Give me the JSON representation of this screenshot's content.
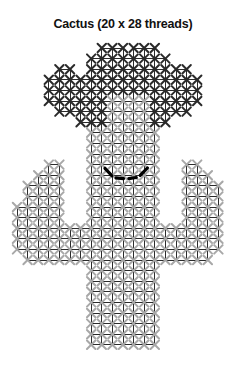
{
  "title": "Cactus (20 x 28 threads)",
  "chart_data": {
    "type": "heatmap",
    "title": "Cactus (20 x 28 threads)",
    "subtitle": "",
    "xlabel": "",
    "ylabel": "",
    "grid": true,
    "legend_position": "none",
    "columns": 20,
    "rows": 28,
    "cell_px": 10.6,
    "origin": {
      "x": 17,
      "y": 12
    },
    "colors": {
      "grid_line": "#2b2b2b",
      "body_stitch": "#a8a8a8",
      "crown_stitch": "#2a2a2a",
      "backstitch": "#000000",
      "background": "#ffffff",
      "title_text": "#111111"
    },
    "legend_entries": [
      {
        "label": "crown / flower stitch",
        "color": "#2a2a2a"
      },
      {
        "label": "body stitch",
        "color": "#a8a8a8"
      },
      {
        "label": "backstitch smile",
        "color": "#000000"
      }
    ],
    "categories": [
      "1",
      "2",
      "3",
      "4",
      "5",
      "6",
      "7",
      "8",
      "9",
      "10",
      "11",
      "12",
      "13",
      "14",
      "15",
      "16",
      "17",
      "18",
      "19",
      "20"
    ],
    "tick_labels_x": [],
    "tick_labels_y": [],
    "xlim": [
      0,
      20
    ],
    "ylim": [
      0,
      28
    ],
    "stitch_rows": [
      {
        "row": 1,
        "crown": [
          9,
          10,
          12,
          13
        ],
        "body": []
      },
      {
        "row": 2,
        "crown": [
          8,
          9,
          10,
          11,
          12,
          13,
          14
        ],
        "body": []
      },
      {
        "row": 3,
        "crown": [
          5,
          8,
          9,
          10,
          11,
          12,
          13,
          14,
          16
        ],
        "body": []
      },
      {
        "row": 4,
        "crown": [
          4,
          5,
          6,
          7,
          8,
          9,
          10,
          11,
          12,
          13,
          14,
          15,
          16,
          17
        ],
        "body": []
      },
      {
        "row": 5,
        "crown": [
          4,
          5,
          6,
          7,
          8,
          14,
          15,
          16,
          17
        ],
        "body": [
          9,
          10,
          11,
          12,
          13
        ]
      },
      {
        "row": 6,
        "crown": [
          5,
          6,
          7,
          15,
          16
        ],
        "body": [
          8,
          9,
          10,
          11,
          12,
          13,
          14
        ]
      },
      {
        "row": 7,
        "crown": [
          7,
          8,
          14
        ],
        "body": [
          9,
          10,
          11,
          12,
          13
        ]
      },
      {
        "row": 8,
        "crown": [],
        "body": [
          8,
          9,
          10,
          11,
          12,
          13
        ]
      },
      {
        "row": 9,
        "crown": [],
        "body": [
          8,
          9,
          10,
          11,
          12,
          13
        ]
      },
      {
        "row": 10,
        "crown": [],
        "body": [
          8,
          9,
          10,
          11,
          12,
          13
        ]
      },
      {
        "row": 11,
        "crown": [],
        "body": [
          8,
          9,
          10,
          11,
          12,
          13
        ]
      },
      {
        "row": 12,
        "crown": [],
        "body": [
          4,
          8,
          9,
          10,
          11,
          12,
          13,
          17
        ]
      },
      {
        "row": 13,
        "crown": [],
        "body": [
          3,
          4,
          8,
          9,
          10,
          11,
          12,
          13,
          17,
          18
        ]
      },
      {
        "row": 14,
        "crown": [],
        "body": [
          2,
          3,
          4,
          8,
          9,
          10,
          11,
          12,
          13,
          17,
          18,
          19
        ]
      },
      {
        "row": 15,
        "crown": [],
        "body": [
          2,
          3,
          4,
          8,
          9,
          10,
          11,
          12,
          13,
          17,
          18,
          19
        ]
      },
      {
        "row": 16,
        "crown": [],
        "body": [
          1,
          2,
          3,
          4,
          8,
          9,
          10,
          11,
          12,
          13,
          17,
          18,
          19
        ]
      },
      {
        "row": 17,
        "crown": [],
        "body": [
          1,
          2,
          3,
          4,
          8,
          9,
          10,
          11,
          12,
          13,
          17,
          18,
          19
        ]
      },
      {
        "row": 18,
        "crown": [],
        "body": [
          1,
          2,
          3,
          4,
          5,
          6,
          7,
          8,
          9,
          10,
          11,
          12,
          13,
          14,
          15,
          16,
          17,
          18,
          19
        ]
      },
      {
        "row": 19,
        "crown": [],
        "body": [
          1,
          2,
          3,
          4,
          5,
          6,
          7,
          8,
          9,
          10,
          11,
          12,
          13,
          14,
          15,
          16,
          17,
          18,
          19
        ]
      },
      {
        "row": 20,
        "crown": [],
        "body": [
          2,
          3,
          4,
          5,
          6,
          7,
          8,
          9,
          10,
          11,
          12,
          13,
          14,
          15,
          16,
          17,
          18
        ]
      },
      {
        "row": 21,
        "crown": [],
        "body": [
          8,
          9,
          10,
          11,
          12,
          13
        ]
      },
      {
        "row": 22,
        "crown": [],
        "body": [
          8,
          9,
          10,
          11,
          12,
          13
        ]
      },
      {
        "row": 23,
        "crown": [],
        "body": [
          8,
          9,
          10,
          11,
          12,
          13
        ]
      },
      {
        "row": 24,
        "crown": [],
        "body": [
          8,
          9,
          10,
          11,
          12,
          13
        ]
      },
      {
        "row": 25,
        "crown": [],
        "body": [
          8,
          9,
          10,
          11,
          12,
          13
        ]
      },
      {
        "row": 26,
        "crown": [],
        "body": [
          8,
          9,
          10,
          11,
          12,
          13
        ]
      },
      {
        "row": 27,
        "crown": [],
        "body": [
          8,
          9,
          10,
          11,
          12,
          13
        ]
      },
      {
        "row": 28,
        "crown": [],
        "body": [
          8,
          9,
          10,
          11,
          12,
          13
        ]
      }
    ],
    "backstitch_smile": {
      "color": "#000000",
      "width_px": 3.2,
      "segments": [
        [
          [
            8.3,
            11.35
          ],
          [
            8.95,
            12.05
          ]
        ],
        [
          [
            9.35,
            12.25
          ],
          [
            10.05,
            12.32
          ]
        ],
        [
          [
            10.55,
            12.32
          ],
          [
            11.25,
            12.22
          ]
        ],
        [
          [
            11.62,
            12.02
          ],
          [
            12.3,
            11.32
          ]
        ]
      ]
    }
  }
}
